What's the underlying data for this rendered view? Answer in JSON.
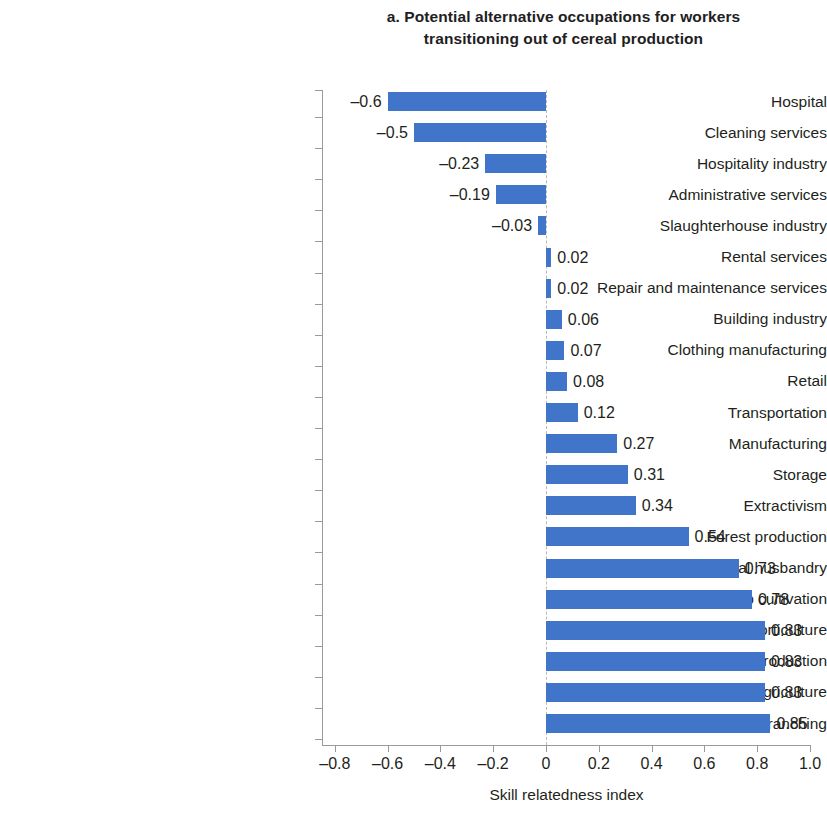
{
  "chart_data": {
    "type": "bar",
    "orientation": "horizontal",
    "title": "a. Potential alternative occupations for workers transitioning out of cereal production",
    "title_lines": [
      "a. Potential alternative occupations for workers",
      "transitioning out of cereal production"
    ],
    "xlabel": "Skill relatedness index",
    "ylabel": "",
    "xlim": [
      -0.8,
      1.0
    ],
    "xticks": [
      -0.8,
      -0.6,
      -0.4,
      -0.2,
      0,
      0.2,
      0.4,
      0.6,
      0.8,
      1.0
    ],
    "xtick_labels": [
      "–0.8",
      "–0.6",
      "–0.4",
      "–0.2",
      "0",
      "0.2",
      "0.4",
      "0.6",
      "0.8",
      "1.0"
    ],
    "grid": false,
    "zero_line": true,
    "legend": null,
    "bar_color": "#4175c9",
    "categories": [
      "Hospital",
      "Cleaning services",
      "Hospitality industry",
      "Administrative services",
      "Slaughterhouse industry",
      "Rental services",
      "Repair and maintenance services",
      "Building industry",
      "Clothing manufacturing",
      "Retail",
      "Transportation",
      "Manufacturing",
      "Storage",
      "Extractivism",
      "Forest production",
      "Animal husbandry",
      "Crop cultivation",
      "Horticulture",
      "Certified seeds production",
      "Agriculture",
      "Cattle ranching"
    ],
    "values": [
      -0.6,
      -0.5,
      -0.23,
      -0.19,
      -0.03,
      0.02,
      0.02,
      0.06,
      0.07,
      0.08,
      0.12,
      0.27,
      0.31,
      0.34,
      0.54,
      0.73,
      0.78,
      0.83,
      0.83,
      0.83,
      0.85
    ],
    "value_labels": [
      "–0.6",
      "–0.5",
      "–0.23",
      "–0.19",
      "–0.03",
      "0.02",
      "0.02",
      "0.06",
      "0.07",
      "0.08",
      "0.12",
      "0.27",
      "0.31",
      "0.34",
      "0.54",
      "0.73",
      "0.78",
      "0.83",
      "0.83",
      "0.83",
      "0.85"
    ]
  }
}
